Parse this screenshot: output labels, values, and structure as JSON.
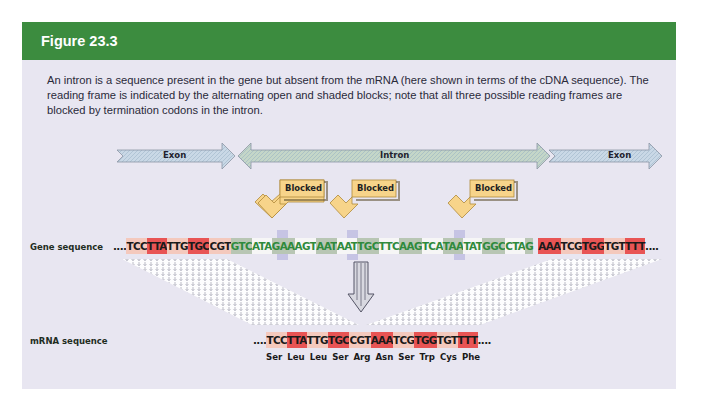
{
  "figure": {
    "title": "Figure 23.3",
    "caption": "An intron is a sequence present in the gene but absent from the mRNA (here shown in terms of the cDNA sequence). The reading frame is indicated by the alternating open and shaded blocks; note that all three possible reading frames are blocked by termination codons in the intron.",
    "colors": {
      "header": "#3c8c3f",
      "panel_bg": "#e8e6f1",
      "codon_highlight": "#e85454",
      "codon_light": "#f4c9bd",
      "intron_text": "#2f8a3c",
      "blocked_callout": "#f6d58a",
      "stop_marker": "#c6c4e4"
    }
  },
  "regions": [
    {
      "label": "Exon",
      "type": "exon-left"
    },
    {
      "label": "Intron",
      "type": "intron"
    },
    {
      "label": "Exon",
      "type": "exon-right"
    }
  ],
  "blocked_callouts": [
    {
      "label": "Blocked"
    },
    {
      "label": "Blocked"
    },
    {
      "label": "Blocked"
    }
  ],
  "gene_sequence": {
    "label": "Gene sequence",
    "prefix": "....",
    "exon1_codons": [
      "TCC",
      "TTA",
      "TTG",
      "TGC",
      "CGT"
    ],
    "intron_codons": [
      "GTC",
      "ATA",
      "GAA",
      "AGT",
      "AAT",
      "AAT",
      "TGC",
      "TTC",
      "AAG",
      "TCA",
      "TAA",
      "TAT",
      "GGC",
      "CTA",
      "G"
    ],
    "intron_full": "GTCATAGAAAGTAATAATTGCTTCAAGTCATAATATGGCCTAG",
    "exon2_codons": [
      "AAA",
      "TCG",
      "TGG",
      "TGT",
      "TTT"
    ],
    "suffix": "...."
  },
  "mrna_sequence": {
    "label": "mRNA sequence",
    "prefix": "....",
    "codons": [
      "TCC",
      "TTA",
      "TTG",
      "TGC",
      "CGT",
      "AAA",
      "TCG",
      "TGG",
      "TGT",
      "TTT"
    ],
    "suffix": "....",
    "amino_acids": [
      "Ser",
      "Leu",
      "Leu",
      "Ser",
      "Arg",
      "Asn",
      "Ser",
      "Trp",
      "Cys",
      "Phe"
    ]
  }
}
